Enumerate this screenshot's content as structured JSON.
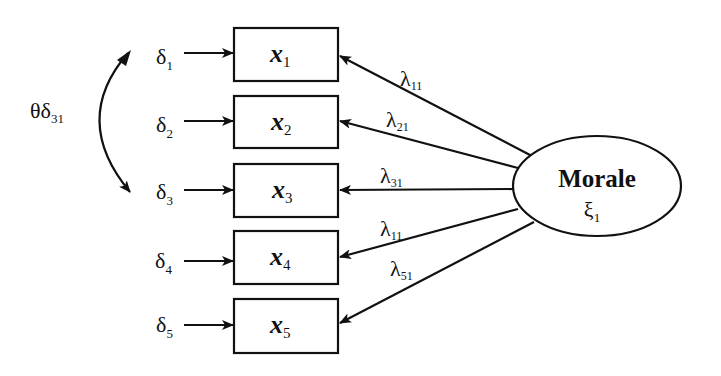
{
  "diagram": {
    "type": "structural-equation-model",
    "latent": {
      "name": "Morale",
      "symbol": "ξ",
      "symbol_sub": "1"
    },
    "covariance": {
      "symbol": "θδ",
      "sub": "31",
      "connects": [
        "δ1",
        "δ3"
      ]
    },
    "indicators": [
      {
        "var": "x",
        "sub": "1",
        "error": "δ",
        "error_sub": "1",
        "loading": "λ",
        "loading_sub": "11"
      },
      {
        "var": "x",
        "sub": "2",
        "error": "δ",
        "error_sub": "2",
        "loading": "λ",
        "loading_sub": "21"
      },
      {
        "var": "x",
        "sub": "3",
        "error": "δ",
        "error_sub": "3",
        "loading": "λ",
        "loading_sub": "31"
      },
      {
        "var": "x",
        "sub": "4",
        "error": "δ",
        "error_sub": "4",
        "loading": "λ",
        "loading_sub": "11"
      },
      {
        "var": "x",
        "sub": "5",
        "error": "δ",
        "error_sub": "5",
        "loading": "λ",
        "loading_sub": "51"
      }
    ]
  }
}
